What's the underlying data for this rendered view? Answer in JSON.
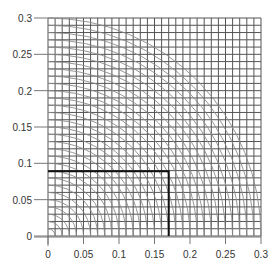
{
  "chart_data": {
    "type": "line",
    "title": "",
    "xlabel": "",
    "ylabel": "",
    "xlim": [
      0,
      0.3
    ],
    "ylim": [
      0,
      0.3
    ],
    "grid": true,
    "grid_step": 0.01,
    "x_ticks": [
      "0",
      "0.05",
      "0.1",
      "0.15",
      "0.2",
      "0.25",
      "0.3"
    ],
    "y_ticks": [
      "0",
      "0.05",
      "0.1",
      "0.15",
      "0.2",
      "0.25",
      "0.3"
    ],
    "x_tick_values": [
      0,
      0.05,
      0.1,
      0.15,
      0.2,
      0.25,
      0.3
    ],
    "y_tick_values": [
      0,
      0.05,
      0.1,
      0.15,
      0.2,
      0.25,
      0.3
    ],
    "series": [
      {
        "name": "quarter-circle arcs",
        "description": "Concentric quarter circles centered at origin",
        "radii_start": 0.01,
        "radii_end": 0.3,
        "radii_step": 0.01,
        "color": "#888888"
      },
      {
        "name": "highlighted rectangle",
        "x": [
          0,
          0.17,
          0.17
        ],
        "y": [
          0.089,
          0.089,
          0
        ],
        "color": "#111111",
        "line_width": 2
      }
    ],
    "legend": null
  },
  "colors": {
    "grid": "#555555",
    "arcs": "#8a8a8a",
    "highlight": "#111111",
    "axis": "#777777",
    "text": "#333333"
  }
}
